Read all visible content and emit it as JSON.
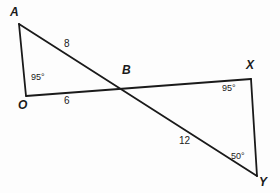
{
  "figure": {
    "background_color": "#fdfdfd",
    "stroke_color": "#1a1a1a",
    "text_color": "#1a1a1a",
    "vertices": [
      {
        "name": "A",
        "label": "A",
        "x": 19,
        "y": 24,
        "label_x": 10,
        "label_y": 6
      },
      {
        "name": "O",
        "label": "O",
        "x": 26,
        "y": 96,
        "label_x": 18,
        "label_y": 99
      },
      {
        "name": "B",
        "label": "B",
        "x": 128,
        "y": 82,
        "label_x": 122,
        "label_y": 64
      },
      {
        "name": "X",
        "label": "X",
        "x": 251,
        "y": 79,
        "label_x": 246,
        "label_y": 59
      },
      {
        "name": "Y",
        "label": "Y",
        "x": 257,
        "y": 176,
        "label_x": 259,
        "label_y": 176
      }
    ],
    "segments": [
      {
        "name": "segment-A-O",
        "from": "A",
        "to": "O"
      },
      {
        "name": "segment-A-Y",
        "from": "A",
        "to": "Y"
      },
      {
        "name": "segment-O-X",
        "from": "O",
        "to": "X"
      },
      {
        "name": "segment-X-Y",
        "from": "X",
        "to": "Y"
      }
    ],
    "side_lengths": [
      {
        "name": "length-AB",
        "value": "8",
        "x": 64,
        "y": 39
      },
      {
        "name": "length-OB",
        "value": "6",
        "x": 64,
        "y": 96
      },
      {
        "name": "length-BY",
        "value": "12",
        "x": 179,
        "y": 136
      }
    ],
    "angles": [
      {
        "name": "angle-at-O",
        "value": "95°",
        "x": 31,
        "y": 73
      },
      {
        "name": "angle-at-X",
        "value": "95°",
        "x": 222,
        "y": 84
      },
      {
        "name": "angle-at-Y",
        "value": "50°",
        "x": 231,
        "y": 152
      }
    ]
  }
}
